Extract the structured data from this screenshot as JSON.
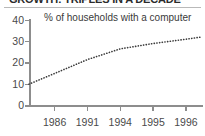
{
  "chart_data": {
    "type": "line",
    "title": "GROWTH: TRIPLES IN A DECADE",
    "subtitle": "% of households with a computer",
    "xlabel": "",
    "ylabel": "",
    "categories": [
      "1986",
      "1991",
      "1994",
      "1995",
      "1996"
    ],
    "x": [
      1986,
      1991,
      1994,
      1995,
      1996
    ],
    "values": [
      15,
      21.5,
      26.5,
      29,
      31
    ],
    "series": [
      {
        "name": "% of households with a computer",
        "values": [
          15,
          21.5,
          26.5,
          29,
          31
        ]
      }
    ],
    "line_style": "dotted",
    "line_color": "#3a3a3a",
    "start_value": 10,
    "end_value": 32,
    "ylim": [
      0,
      40
    ],
    "yticks": [
      0,
      10,
      20,
      30,
      40
    ],
    "ytick_labels": [
      "0",
      "10",
      "20",
      "30",
      "40"
    ],
    "xtick_labels": [
      "1986",
      "1991",
      "1994",
      "1995",
      "1996"
    ],
    "grid": false,
    "legend": false,
    "legend_position": "none",
    "background_color": "#ffffff",
    "axis_color": "#8d8d8d",
    "text_color": "#3a3a3a"
  },
  "figure": {
    "title": "GROWTH: TRIPLES IN A DECADE",
    "subtitle": "% of households with a computer"
  },
  "axes": {
    "y": {
      "ticks": [
        {
          "label": "40",
          "value": 40
        },
        {
          "label": "30",
          "value": 30
        },
        {
          "label": "20",
          "value": 20
        },
        {
          "label": "10",
          "value": 10
        },
        {
          "label": "0",
          "value": 0
        }
      ]
    },
    "x": {
      "ticks": [
        {
          "label": "1986"
        },
        {
          "label": "1991"
        },
        {
          "label": "1994"
        },
        {
          "label": "1995"
        },
        {
          "label": "1996"
        }
      ]
    }
  }
}
